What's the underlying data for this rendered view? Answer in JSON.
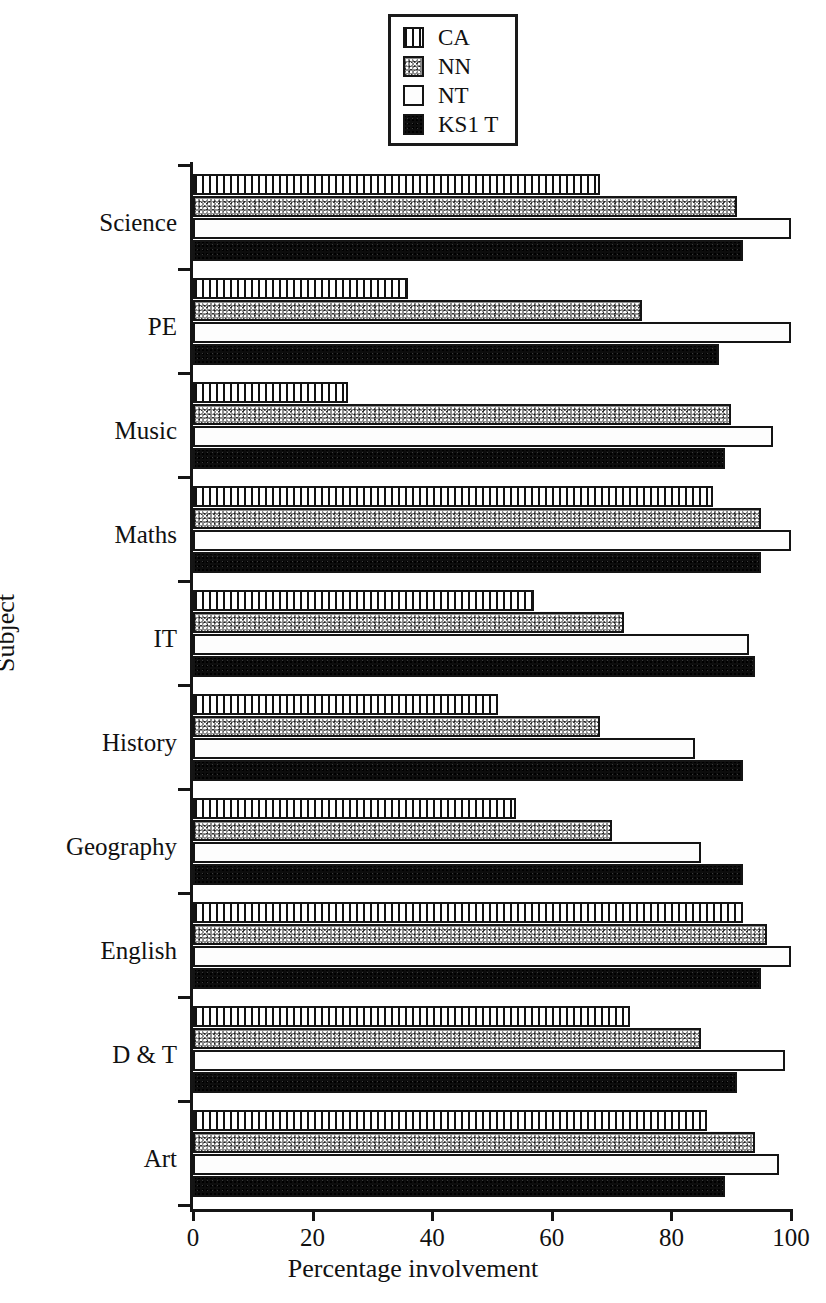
{
  "legend": {
    "position": "top-center",
    "entries": [
      {
        "label": "CA",
        "pattern": "vertical-hatch",
        "swatch": "fill-ca"
      },
      {
        "label": "NN",
        "pattern": "speckled-grey",
        "swatch": "fill-nn"
      },
      {
        "label": "NT",
        "pattern": "white-empty",
        "swatch": "fill-nt"
      },
      {
        "label": "KS1 T",
        "pattern": "solid-black",
        "swatch": "fill-kt"
      }
    ]
  },
  "axes": {
    "x_title": "Percentage involvement",
    "y_title": "Subject",
    "x_ticks": [
      "0",
      "20",
      "40",
      "60",
      "80",
      "100"
    ],
    "x_tick_values": [
      0,
      20,
      40,
      60,
      80,
      100
    ],
    "x_min": 0,
    "x_max": 100
  },
  "chart_data": {
    "type": "bar",
    "orientation": "horizontal",
    "title": "",
    "xlabel": "Percentage involvement",
    "ylabel": "Subject",
    "xlim": [
      0,
      100
    ],
    "grid": false,
    "legend_position": "top-center",
    "categories": [
      "Science",
      "PE",
      "Music",
      "Maths",
      "IT",
      "History",
      "Geography",
      "English",
      "D & T",
      "Art"
    ],
    "series": [
      {
        "name": "CA",
        "values": [
          68,
          36,
          26,
          87,
          57,
          51,
          54,
          92,
          73,
          86
        ]
      },
      {
        "name": "NN",
        "values": [
          91,
          75,
          90,
          95,
          72,
          68,
          70,
          96,
          85,
          94
        ]
      },
      {
        "name": "NT",
        "values": [
          100,
          100,
          97,
          100,
          93,
          84,
          85,
          100,
          99,
          98
        ]
      },
      {
        "name": "KS1 T",
        "values": [
          92,
          88,
          89,
          95,
          94,
          92,
          92,
          95,
          91,
          89
        ]
      }
    ]
  }
}
